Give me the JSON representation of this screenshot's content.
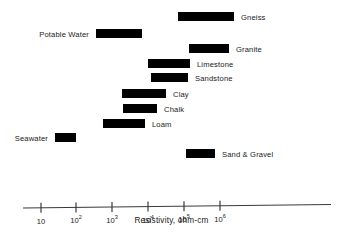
{
  "chart_data": {
    "type": "bar",
    "orientation": "horizontal-range",
    "title": "",
    "xlabel": "Resistivity, ohm-cm",
    "ylabel": "",
    "xscale": "log",
    "xlim": [
      10,
      5000000
    ],
    "grid": false,
    "legend": null,
    "tick_labels": [
      "10",
      "10²",
      "10³",
      "10⁴",
      "10⁵",
      "10⁶"
    ],
    "tick_bases": [
      "10",
      "10",
      "10",
      "10",
      "10",
      "10"
    ],
    "tick_exponents": [
      "",
      "2",
      "3",
      "4",
      "5",
      "6"
    ],
    "tick_values": [
      10,
      100,
      1000,
      10000,
      100000,
      1000000
    ],
    "bar_color": "#000000",
    "categories": [
      "Gneiss",
      "Potable Water",
      "Granite",
      "Limestone",
      "Sandstone",
      "Clay",
      "Chalk",
      "Loam",
      "Seawater",
      "Sand & Gravel"
    ],
    "ranges": [
      {
        "name": "Gneiss",
        "min": 68000,
        "max": 7800000,
        "label_side": "right"
      },
      {
        "name": "Potable Water",
        "min": 36,
        "max": 860,
        "label_side": "left"
      },
      {
        "name": "Granite",
        "min": 160000,
        "max": 2400000,
        "label_side": "right"
      },
      {
        "name": "Limestone",
        "min": 1900,
        "max": 84000,
        "label_side": "right"
      },
      {
        "name": "Sandstone",
        "min": 2400,
        "max": 73000,
        "label_side": "right"
      },
      {
        "name": "Clay",
        "min": 280,
        "max": 6800,
        "label_side": "right"
      },
      {
        "name": "Chalk",
        "min": 300,
        "max": 3300,
        "label_side": "right"
      },
      {
        "name": "Loam",
        "min": 76,
        "max": 1500,
        "label_side": "right"
      },
      {
        "name": "Seawater",
        "min": 2.6,
        "max": 12,
        "label_side": "left"
      },
      {
        "name": "Sand & Gravel",
        "min": 130000,
        "max": 800000,
        "label_side": "right"
      }
    ]
  },
  "axis": {
    "title": "Resistivity, ohm-cm"
  },
  "bars": [
    {
      "label": "Gneiss",
      "side": "right",
      "x": 178,
      "w": 56,
      "y": 12
    },
    {
      "label": "Potable Water",
      "side": "left",
      "x": 96,
      "w": 46,
      "y": 29
    },
    {
      "label": "Granite",
      "side": "right",
      "x": 189,
      "w": 40,
      "y": 44
    },
    {
      "label": "Limestone",
      "side": "right",
      "x": 148,
      "w": 42,
      "y": 59
    },
    {
      "label": "Sandstone",
      "side": "right",
      "x": 151,
      "w": 37,
      "y": 73
    },
    {
      "label": "Clay",
      "side": "right",
      "x": 122,
      "w": 44,
      "y": 89
    },
    {
      "label": "Chalk",
      "side": "right",
      "x": 123,
      "w": 34,
      "y": 104
    },
    {
      "label": "Loam",
      "side": "right",
      "x": 103,
      "w": 42,
      "y": 119
    },
    {
      "label": "Seawater",
      "side": "left",
      "x": 55,
      "w": 21,
      "y": 133
    },
    {
      "label": "Sand & Gravel",
      "side": "right",
      "x": 186,
      "w": 29,
      "y": 149
    }
  ],
  "ticks": [
    {
      "base": "10",
      "exp": "",
      "x": 41
    },
    {
      "base": "10",
      "exp": "2",
      "x": 76
    },
    {
      "base": "10",
      "exp": "3",
      "x": 112
    },
    {
      "base": "10",
      "exp": "4",
      "x": 148
    },
    {
      "base": "10",
      "exp": "5",
      "x": 184
    },
    {
      "base": "10",
      "exp": "6",
      "x": 220
    }
  ]
}
